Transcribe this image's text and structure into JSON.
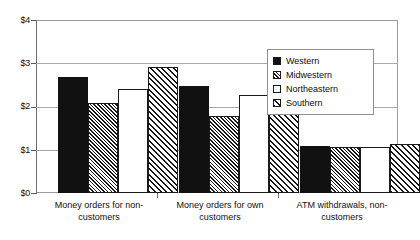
{
  "chart_data": {
    "type": "bar",
    "title": "",
    "xlabel": "",
    "ylabel": "",
    "grid": true,
    "legend_position": "inside-top-right",
    "ylim": [
      0,
      4
    ],
    "yticks": [
      0,
      1,
      2,
      3,
      4
    ],
    "ytick_labels": [
      "$0",
      "$1",
      "$2",
      "$3",
      "$4"
    ],
    "categories": [
      "Money orders for non-customers",
      "Money orders for own customers",
      "ATM withdrawals, non-customers"
    ],
    "category_label_lines": [
      [
        "Money orders for non-",
        "customers"
      ],
      [
        "Money orders for own",
        "customers"
      ],
      [
        "ATM withdrawals, non-",
        "customers"
      ]
    ],
    "series": [
      {
        "name": "Western",
        "pattern": "solid-black",
        "values": [
          2.68,
          2.47,
          1.08
        ]
      },
      {
        "name": "Midwestern",
        "pattern": "hatch-dense",
        "values": [
          2.07,
          1.78,
          1.07
        ]
      },
      {
        "name": "Northeastern",
        "pattern": "white-empty",
        "values": [
          2.41,
          2.27,
          1.06
        ]
      },
      {
        "name": "Southern",
        "pattern": "hatch-wide",
        "values": [
          2.91,
          2.22,
          1.14
        ]
      }
    ]
  },
  "legend": {
    "items": [
      {
        "label": "Western"
      },
      {
        "label": "Midwestern"
      },
      {
        "label": "Northeastern"
      },
      {
        "label": "Southern"
      }
    ]
  },
  "colors": {
    "series_fill": "#111111",
    "axis": "#6d6d6d",
    "gridline": "#a8a8a8",
    "background": "#ffffff"
  }
}
